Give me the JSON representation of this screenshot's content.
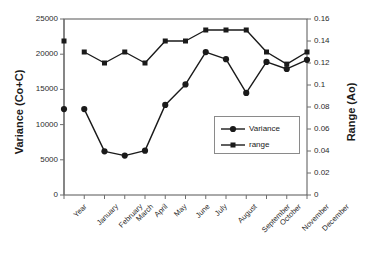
{
  "chart_data": {
    "type": "line",
    "title": "",
    "subtitle": "",
    "xlabel": "",
    "ylabel": "Variance (Co+C)",
    "y2label": "Range (Ao)",
    "grid": false,
    "legend_position": "inside-right",
    "categories": [
      "Year",
      "January",
      "February",
      "March",
      "April",
      "May",
      "June",
      "July",
      "August",
      "September",
      "October",
      "November",
      "December"
    ],
    "ylim": [
      0,
      25000
    ],
    "y2lim": [
      0,
      0.16
    ],
    "yticks": [
      "0",
      "5000",
      "10000",
      "15000",
      "20000",
      "25000"
    ],
    "ytick_values": [
      0,
      5000,
      10000,
      15000,
      20000,
      25000
    ],
    "y2ticks": [
      "0",
      "0.02",
      "0.04",
      "0.06",
      "0.08",
      "0.1",
      "0.12",
      "0.14",
      "0.16"
    ],
    "y2tick_values": [
      0,
      0.02,
      0.04,
      0.06,
      0.08,
      0.1,
      0.12,
      0.14,
      0.16
    ],
    "series": [
      {
        "name": "Variance",
        "axis": "left",
        "marker": "circle",
        "color": "#1a1a1a",
        "values": [
          12200,
          12200,
          6200,
          5600,
          6300,
          12800,
          15700,
          20300,
          19300,
          14500,
          18900,
          17900,
          19200
        ]
      },
      {
        "name": "range",
        "axis": "right",
        "marker": "square",
        "color": "#1a1a1a",
        "values": [
          0.14,
          0.13,
          0.12,
          0.13,
          0.12,
          0.14,
          0.14,
          0.15,
          0.15,
          0.15,
          0.13,
          0.119,
          0.13
        ]
      }
    ]
  },
  "legend": {
    "items": [
      {
        "label": "Variance",
        "marker": "circle"
      },
      {
        "label": "range",
        "marker": "square"
      }
    ]
  },
  "caption": {
    "text": ""
  },
  "colors": {
    "line": "#1a1a1a",
    "axis": "#6f6f6f",
    "frame": "#555555",
    "background": "#ffffff"
  }
}
